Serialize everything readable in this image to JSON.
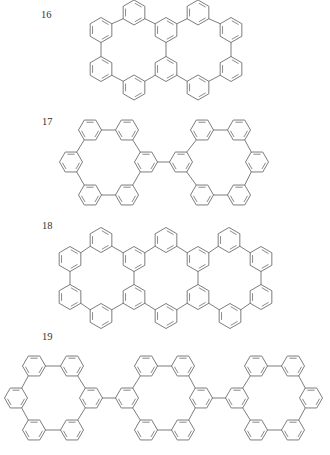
{
  "colors": {
    "stroke": "#6e6e6e",
    "background": "#ffffff",
    "label": "#333333"
  },
  "structures": [
    {
      "id": "16",
      "label": "16",
      "label_pos": [
        41,
        10
      ],
      "orientation": "pointy",
      "radius": 12.5,
      "rings": {
        "A": [
          134,
          12.5
        ],
        "B": [
          101,
          30
        ],
        "C": [
          101,
          69
        ],
        "D": [
          134,
          87.5
        ],
        "E": [
          166,
          30
        ],
        "F": [
          166,
          69
        ],
        "G": [
          198,
          12.5
        ],
        "H": [
          231,
          30
        ],
        "I": [
          231,
          69
        ],
        "J": [
          198,
          87.5
        ]
      },
      "bonds": [
        [
          "A",
          "B"
        ],
        [
          "B",
          "C"
        ],
        [
          "C",
          "D"
        ],
        [
          "D",
          "F"
        ],
        [
          "A",
          "E"
        ],
        [
          "E",
          "G"
        ],
        [
          "E",
          "F"
        ],
        [
          "G",
          "H"
        ],
        [
          "H",
          "I"
        ],
        [
          "I",
          "J"
        ],
        [
          "J",
          "F"
        ]
      ]
    },
    {
      "id": "17",
      "label": "17",
      "label_pos": [
        42,
        117
      ],
      "orientation": "flat",
      "radius": 11.5,
      "rings": {
        "aTL": [
          90,
          130
        ],
        "aTR": [
          127,
          130
        ],
        "aL": [
          71,
          162
        ],
        "aR": [
          146,
          162
        ],
        "aBL": [
          90,
          195
        ],
        "aBR": [
          127,
          195
        ],
        "bL": [
          181,
          162
        ],
        "bTL": [
          202,
          130
        ],
        "bTR": [
          239,
          130
        ],
        "bR": [
          257,
          162
        ],
        "bBL": [
          202,
          195
        ],
        "bBR": [
          239,
          195
        ]
      },
      "bonds": [
        [
          "aTL",
          "aTR"
        ],
        [
          "aTL",
          "aL"
        ],
        [
          "aL",
          "aBL"
        ],
        [
          "aBL",
          "aBR"
        ],
        [
          "aBR",
          "aR"
        ],
        [
          "aR",
          "aTR"
        ],
        [
          "bL",
          "bTL"
        ],
        [
          "bTL",
          "bTR"
        ],
        [
          "bTR",
          "bR"
        ],
        [
          "bR",
          "bBR"
        ],
        [
          "bBR",
          "bBL"
        ],
        [
          "bBL",
          "bL"
        ],
        [
          "aR",
          "bL"
        ]
      ]
    },
    {
      "id": "18",
      "label": "18",
      "label_pos": [
        42,
        221
      ],
      "orientation": "pointy",
      "radius": 12.5,
      "rings": {
        "T1": [
          101,
          240
        ],
        "T2": [
          166,
          240
        ],
        "T3": [
          229,
          240
        ],
        "U1": [
          70,
          259
        ],
        "U2": [
          134,
          259
        ],
        "U3": [
          198,
          259
        ],
        "U4": [
          261,
          259
        ],
        "L1": [
          70,
          297
        ],
        "L2": [
          134,
          297
        ],
        "L3": [
          198,
          297
        ],
        "L4": [
          261,
          297
        ],
        "B1": [
          101,
          316
        ],
        "B2": [
          166,
          316
        ],
        "B3": [
          230,
          316
        ]
      },
      "bonds": [
        [
          "U1",
          "T1"
        ],
        [
          "T1",
          "U2"
        ],
        [
          "U2",
          "T2"
        ],
        [
          "T2",
          "U3"
        ],
        [
          "U3",
          "T3"
        ],
        [
          "T3",
          "U4"
        ],
        [
          "U4",
          "L4"
        ],
        [
          "L4",
          "B3"
        ],
        [
          "B3",
          "L3"
        ],
        [
          "L3",
          "B2"
        ],
        [
          "B2",
          "L2"
        ],
        [
          "L2",
          "B1"
        ],
        [
          "B1",
          "L1"
        ],
        [
          "L1",
          "U1"
        ],
        [
          "U2",
          "L2"
        ],
        [
          "U3",
          "L3"
        ]
      ]
    },
    {
      "id": "19",
      "label": "19",
      "label_pos": [
        42,
        332
      ],
      "orientation": "flat",
      "radius": 11.5,
      "rings": {
        "aTL": [
          34,
          366
        ],
        "aTR": [
          72,
          366
        ],
        "aL": [
          16,
          398
        ],
        "aR": [
          91,
          398
        ],
        "aBL": [
          34,
          430
        ],
        "aBR": [
          72,
          430
        ],
        "bL": [
          127,
          398
        ],
        "bTL": [
          146,
          366
        ],
        "bTR": [
          183,
          366
        ],
        "bR": [
          201,
          398
        ],
        "bBL": [
          146,
          430
        ],
        "bBR": [
          183,
          430
        ],
        "cL": [
          237,
          398
        ],
        "cTL": [
          256,
          366
        ],
        "cTR": [
          293,
          366
        ],
        "cR": [
          311,
          398
        ],
        "cBL": [
          256,
          430
        ],
        "cBR": [
          293,
          430
        ]
      },
      "bonds": [
        [
          "aTL",
          "aTR"
        ],
        [
          "aTL",
          "aL"
        ],
        [
          "aL",
          "aBL"
        ],
        [
          "aBL",
          "aBR"
        ],
        [
          "aBR",
          "aR"
        ],
        [
          "aR",
          "aTR"
        ],
        [
          "bL",
          "bTL"
        ],
        [
          "bTL",
          "bTR"
        ],
        [
          "bTR",
          "bR"
        ],
        [
          "bR",
          "bBR"
        ],
        [
          "bBR",
          "bBL"
        ],
        [
          "bBL",
          "bL"
        ],
        [
          "cL",
          "cTL"
        ],
        [
          "cTL",
          "cTR"
        ],
        [
          "cTR",
          "cR"
        ],
        [
          "cR",
          "cBR"
        ],
        [
          "cBR",
          "cBL"
        ],
        [
          "cBL",
          "cL"
        ],
        [
          "aR",
          "bL"
        ],
        [
          "bR",
          "cL"
        ]
      ]
    }
  ]
}
